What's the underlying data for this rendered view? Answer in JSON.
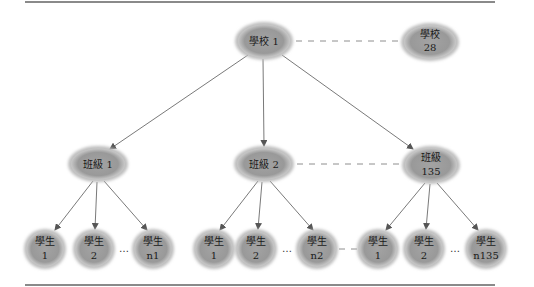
{
  "diagram": {
    "type": "hierarchy-tree",
    "colors": {
      "node_fill": "#9a9a9a",
      "edge": "#6a6a6a",
      "dash": "#8e8e8e",
      "rule": "#8a8a8a"
    },
    "root": {
      "line1": "學校 1",
      "line2": ""
    },
    "sibling_school": {
      "line1": "學校",
      "line2": "28"
    },
    "classes": [
      {
        "line1": "班級 1",
        "line2": ""
      },
      {
        "line1": "班級 2",
        "line2": ""
      },
      {
        "line1": "班級",
        "line2": "135"
      }
    ],
    "students": [
      {
        "line1": "學生",
        "line2": "1"
      },
      {
        "line1": "學生",
        "line2": "2"
      },
      {
        "line1": "學生",
        "line2": "n1"
      },
      {
        "line1": "學生",
        "line2": "1"
      },
      {
        "line1": "學生",
        "line2": "2"
      },
      {
        "line1": "學生",
        "line2": "n2"
      },
      {
        "line1": "學生",
        "line2": "1"
      },
      {
        "line1": "學生",
        "line2": "2"
      },
      {
        "line1": "學生",
        "line2": "n135"
      }
    ],
    "ellipsis": "…"
  }
}
